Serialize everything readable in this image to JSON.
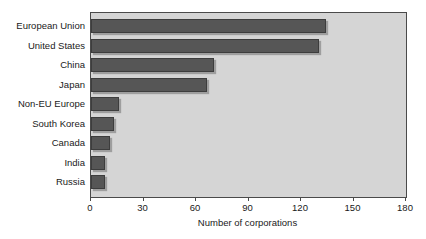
{
  "chart_data": {
    "type": "bar",
    "orientation": "horizontal",
    "title": "",
    "xlabel": "Number of corporations",
    "ylabel": "",
    "categories": [
      "European Union",
      "United States",
      "China",
      "Japan",
      "Non-EU Europe",
      "South Korea",
      "Canada",
      "India",
      "Russia"
    ],
    "values": [
      134,
      130,
      70,
      66,
      16,
      13,
      11,
      8,
      8
    ],
    "xlim": [
      0,
      180
    ],
    "xticks": [
      0,
      30,
      60,
      90,
      120,
      150,
      180
    ],
    "xtick_labels": [
      "0",
      "30",
      "60",
      "90",
      "120",
      "150",
      "180"
    ],
    "grid": false,
    "legend": null,
    "bar_color": "#565656",
    "plot_background": "#d5d5d5",
    "canvas_background": "#ffffff",
    "axis_color": "#4a4a4a",
    "text_color": "#1a1a1a"
  }
}
